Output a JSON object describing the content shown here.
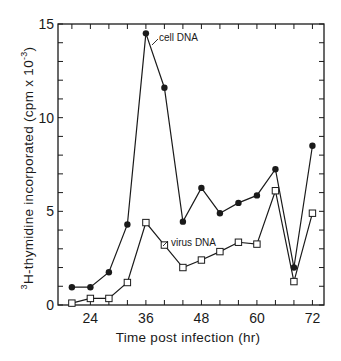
{
  "chart_data": {
    "type": "line",
    "title": "",
    "xlabel": "Time post infection (hr)",
    "ylabel_sup": "3",
    "ylabel": "H-thymidine incorporated (cpm x 10",
    "ylabel_exp": "-3",
    "ylabel_close": ")",
    "xlim": [
      17,
      74.5
    ],
    "ylim": [
      0,
      15
    ],
    "x_ticks": [
      24,
      36,
      48,
      60,
      72
    ],
    "x_minor_step": 4,
    "y_ticks": [
      0,
      5,
      10,
      15
    ],
    "y_minor_step": 1,
    "grid": false,
    "legend": "inline labels",
    "x": [
      20,
      24,
      28,
      32,
      36,
      40,
      44,
      48,
      52,
      56,
      60,
      64,
      68,
      72
    ],
    "series": [
      {
        "name": "cell DNA",
        "marker": "filled-circle",
        "values": [
          0.95,
          0.95,
          1.75,
          4.3,
          14.5,
          11.6,
          4.45,
          6.25,
          4.9,
          5.45,
          5.85,
          7.25,
          2.0,
          8.5
        ]
      },
      {
        "name": "virus DNA",
        "marker": "open-square",
        "values": [
          0.1,
          0.35,
          0.35,
          1.2,
          4.4,
          3.2,
          2.0,
          2.4,
          2.85,
          3.35,
          3.25,
          6.1,
          1.25,
          4.9
        ]
      }
    ]
  },
  "labels": {
    "cell": "cell DNA",
    "virus": "virus DNA"
  },
  "colors": {
    "ink": "#1a1a1a",
    "background": "#ffffff"
  }
}
